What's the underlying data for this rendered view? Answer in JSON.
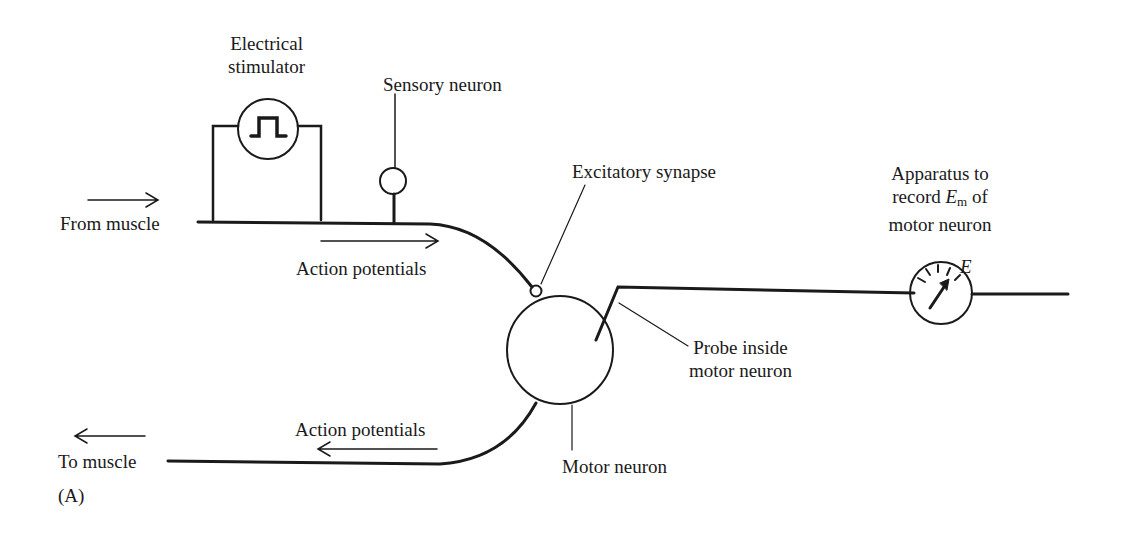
{
  "figure": {
    "panel_label": "(A)",
    "labels": {
      "stimulator_line1": "Electrical",
      "stimulator_line2": "stimulator",
      "sensory_neuron": "Sensory neuron",
      "from_muscle": "From muscle",
      "action_potentials_in": "Action potentials",
      "excitatory_synapse": "Excitatory synapse",
      "apparatus_line1": "Apparatus to",
      "apparatus_line2_pre": "record ",
      "apparatus_E": "E",
      "apparatus_sub": "m",
      "apparatus_line2_post": " of",
      "apparatus_line3": "motor neuron",
      "meter_E": "E",
      "probe_line1": "Probe inside",
      "probe_line2": "motor neuron",
      "action_potentials_out": "Action potentials",
      "to_muscle": "To muscle",
      "motor_neuron": "Motor neuron"
    },
    "colors": {
      "ink": "#1a1a1a",
      "background": "#ffffff"
    }
  }
}
